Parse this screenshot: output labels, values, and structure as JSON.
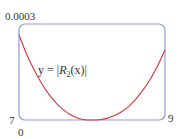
{
  "chart_data": {
    "type": "line",
    "title": "",
    "xlabel": "",
    "ylabel": "",
    "xlim": [
      7,
      9
    ],
    "ylim": [
      0,
      0.0003
    ],
    "grid": false,
    "ticks": {
      "y_top": "0.0003",
      "y_bottom": "0",
      "x_left": "7",
      "x_right": "9"
    },
    "annotation": {
      "prefix": "y = |",
      "func": "R",
      "subscript": "2",
      "suffix": "(x)|"
    },
    "series": [
      {
        "name": "y = |R2(x)|",
        "color": "#d9343a",
        "x": [
          7.0,
          7.1,
          7.2,
          7.3,
          7.4,
          7.5,
          7.6,
          7.7,
          7.8,
          7.9,
          8.0,
          8.1,
          8.2,
          8.3,
          8.4,
          8.5,
          8.6,
          8.7,
          8.8,
          8.9,
          9.0
        ],
        "y": [
          0.000266,
          0.000208,
          0.00016,
          0.000118,
          8.3e-05,
          5.5e-05,
          3.3e-05,
          1.7e-05,
          6e-06,
          1e-06,
          0.0,
          1e-06,
          5e-06,
          1.3e-05,
          2.5e-05,
          4.2e-05,
          6.5e-05,
          9.4e-05,
          0.000128,
          0.00017,
          0.000219
        ]
      }
    ],
    "frame_color": "#8f9dd3"
  }
}
